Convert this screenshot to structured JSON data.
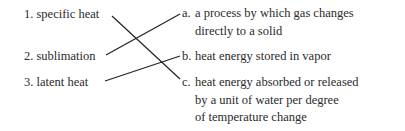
{
  "terms": [
    {
      "number": "1.",
      "label": "specific heat"
    },
    {
      "number": "2.",
      "label": "sublimation"
    },
    {
      "number": "3.",
      "label": "latent heat"
    }
  ],
  "definitions": [
    {
      "letter": "a.",
      "lines": [
        "a process by which gas changes",
        "directly to a solid"
      ]
    },
    {
      "letter": "b.",
      "lines": [
        "heat energy stored in vapor"
      ]
    },
    {
      "letter": "c.",
      "lines": [
        "heat energy absorbed or released",
        "by a unit of water per degree",
        "of temperature change"
      ]
    }
  ],
  "matches": [
    {
      "term": "1",
      "definition": "c"
    },
    {
      "term": "2",
      "definition": "a"
    },
    {
      "term": "3",
      "definition": "b"
    }
  ],
  "colors": {
    "text": "#2a2a2a",
    "line": "#222222"
  }
}
